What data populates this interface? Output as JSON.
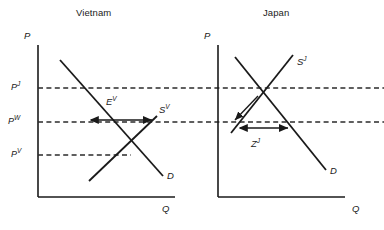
{
  "figure": {
    "width": 384,
    "height": 230,
    "background": "#ffffff",
    "stroke_color": "#1a1a1a",
    "dash_color": "#2b2b2b"
  },
  "panels": [
    {
      "id": "vietnam",
      "title": "Vietnam",
      "title_x": 76,
      "title_y": 14,
      "axis": {
        "y_label": "P",
        "y_label_x": 24,
        "y_label_y": 36,
        "x_label": "Q",
        "x_label_x": 162,
        "x_label_y": 209,
        "origin_x": 38,
        "top_y": 45,
        "bottom_y": 197,
        "right_x": 175
      },
      "curves": [
        {
          "name": "demand-curve-vietnam",
          "label": "D",
          "label_x": 168,
          "label_y": 178,
          "x1": 60,
          "y1": 60,
          "x2": 163,
          "y2": 176
        },
        {
          "name": "supply-curve-vietnam",
          "label": "S",
          "label_sup": "V",
          "label_x": 159,
          "label_y": 110,
          "x1": 89,
          "y1": 181,
          "x2": 157,
          "y2": 116
        }
      ],
      "price_lines": [
        {
          "name": "price-line-pj",
          "label": "P",
          "sup": "J",
          "y": 88,
          "x_start": 38,
          "x_end": 384,
          "label_x": 11,
          "label_y": 82
        },
        {
          "name": "price-line-pw",
          "label": "P",
          "sup": "W",
          "y": 122,
          "x_start": 38,
          "x_end": 384,
          "label_x": 8,
          "label_y": 116
        },
        {
          "name": "price-line-pv",
          "label": "P",
          "sup": "V",
          "y": 155,
          "x_start": 38,
          "x_end": 131,
          "label_x": 11,
          "label_y": 149
        }
      ],
      "flow": {
        "name": "export-flow-vietnam",
        "label": "E",
        "sup": "V",
        "label_x": 108,
        "label_y": 104,
        "arrow_y": 120,
        "arrow_x1": 91,
        "arrow_x2": 152
      }
    },
    {
      "id": "japan",
      "title": "Japan",
      "title_x": 263,
      "title_y": 14,
      "axis": {
        "y_label": "P",
        "y_label_x": 204,
        "y_label_y": 36,
        "x_label": "Q",
        "x_label_x": 352,
        "x_label_y": 209,
        "origin_x": 218,
        "top_y": 45,
        "bottom_y": 197,
        "right_x": 345
      },
      "curves": [
        {
          "name": "demand-curve-japan",
          "label": "D",
          "label_x": 331,
          "label_y": 172,
          "x1": 235,
          "y1": 57,
          "x2": 326,
          "y2": 170
        },
        {
          "name": "supply-curve-japan",
          "label": "S",
          "label_sup": "J",
          "label_x": 297,
          "label_y": 62,
          "x1": 231,
          "y1": 133,
          "x2": 293,
          "y2": 55
        }
      ],
      "flow": {
        "name": "import-flow-japan",
        "label": "Z",
        "sup": "J",
        "label_x": 253,
        "label_y": 146,
        "arrow_y": 128,
        "arrow_x1": 240,
        "arrow_x2": 288
      },
      "adjust_arrow": {
        "name": "price-adjustment-arrow-japan",
        "x1": 258,
        "y1": 96,
        "x2": 235,
        "y2": 120
      }
    }
  ]
}
